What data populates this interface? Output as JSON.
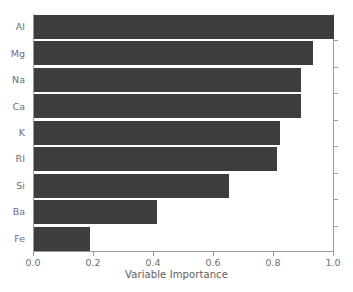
{
  "chart_data": {
    "type": "bar",
    "orientation": "horizontal",
    "title": "",
    "xlabel": "Variable Importance",
    "ylabel": "",
    "categories": [
      "Al",
      "Mg",
      "Na",
      "Ca",
      "K",
      "RI",
      "Si",
      "Ba",
      "Fe"
    ],
    "values": [
      1.0,
      0.93,
      0.89,
      0.89,
      0.82,
      0.81,
      0.65,
      0.41,
      0.185
    ],
    "xlim": [
      0.0,
      1.0
    ],
    "xticks": [
      0.0,
      0.2,
      0.4,
      0.6,
      0.8,
      1.0
    ],
    "xtick_labels": [
      "0.0",
      "0.2",
      "0.4",
      "0.6",
      "0.8",
      "1.0"
    ],
    "grid": false,
    "legend": null,
    "bar_color": "#3d3d3d",
    "background_color": "#ffffff",
    "axis_color": "#9a9a9a",
    "text_color": "#6e6e6e"
  }
}
